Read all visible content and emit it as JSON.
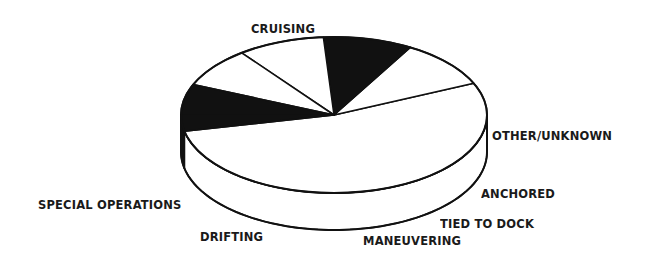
{
  "chart_data": {
    "type": "pie",
    "style": "3d-exploded-none",
    "title": "",
    "units": "percent (estimated from slice angles)",
    "slices": [
      {
        "label": "CRUISING",
        "value": 53.3,
        "fill": "#ffffff",
        "label_pos": [
          251,
          21
        ]
      },
      {
        "label": "SPECIAL OPERATIONS",
        "value": 10.0,
        "fill": "#ffffff",
        "label_pos": [
          38,
          197
        ]
      },
      {
        "label": "DRIFTING",
        "value": 9.4,
        "fill": "#111111",
        "label_pos": [
          200,
          229
        ]
      },
      {
        "label": "MANEUVERING",
        "value": 9.2,
        "fill": "#ffffff",
        "label_pos": [
          363,
          233
        ]
      },
      {
        "label": "TIED TO DOCK",
        "value": 8.3,
        "fill": "#ffffff",
        "label_pos": [
          440,
          216
        ]
      },
      {
        "label": "ANCHORED",
        "value": 6.4,
        "fill": "#111111",
        "label_pos": [
          481,
          186
        ]
      },
      {
        "label": "OTHER/UNKNOWN",
        "value": 3.3,
        "fill": "#111111",
        "label_pos": [
          492,
          128
        ]
      }
    ],
    "geometry": {
      "cx": 334,
      "cy": 115,
      "rx": 153,
      "ry": 78,
      "depth": 37,
      "start_angle_deg": 168,
      "direction": "clockwise-on-screen"
    },
    "legend": "none (labels placed next to slices)",
    "outline_color": "#111111",
    "background": "#ffffff"
  }
}
